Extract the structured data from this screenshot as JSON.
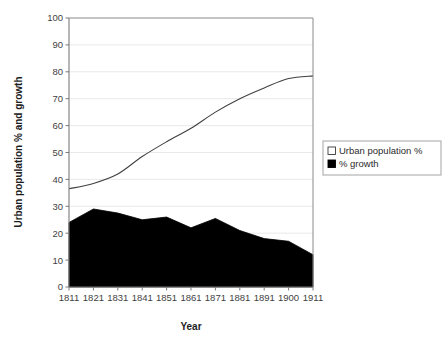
{
  "chart_data": {
    "type": "area",
    "title": "",
    "xlabel": "Year",
    "ylabel": "Urban population % and growth",
    "categories": [
      "1811",
      "1821",
      "1831",
      "1841",
      "1851",
      "1861",
      "1871",
      "1881",
      "1891",
      "1900",
      "1911"
    ],
    "ylim": [
      0,
      100
    ],
    "ytick_step": 10,
    "yticks": [
      "0",
      "10",
      "20",
      "30",
      "40",
      "50",
      "60",
      "70",
      "80",
      "90",
      "100"
    ],
    "grid": "horizontal",
    "legend_position": "right",
    "series": [
      {
        "name": "Urban population %",
        "type": "line",
        "marker": "open-square",
        "color": "#404040",
        "fill": "#ffffff",
        "values": [
          36.5,
          38.5,
          42,
          48.5,
          54,
          59,
          65,
          70,
          74,
          77.5,
          78.5
        ]
      },
      {
        "name": "% growth",
        "type": "area",
        "marker": "filled-square",
        "color": "#000000",
        "fill": "#000000",
        "values": [
          24,
          29,
          27.5,
          25,
          26,
          22,
          25.5,
          21,
          18,
          17,
          12
        ]
      }
    ]
  },
  "axes": {
    "x_title": "Year",
    "y_title": "Urban population % and growth"
  },
  "legend": {
    "entries": [
      {
        "label": "Urban population %",
        "swatch": "open-square"
      },
      {
        "label": "% growth",
        "swatch": "filled-square"
      }
    ]
  },
  "colors": {
    "plot_border": "#808080",
    "gridline": "#e6e6e6",
    "growth_fill": "#000000",
    "urban_line": "#4a4a4a",
    "text": "#333333"
  }
}
